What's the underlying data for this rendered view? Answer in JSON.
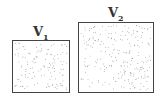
{
  "diagram": {
    "containers": [
      {
        "label_main": "V",
        "label_sub": "1",
        "box": {
          "x": 12,
          "y": 40,
          "w": 58,
          "h": 53
        },
        "particle_count": 130
      },
      {
        "label_main": "V",
        "label_sub": "2",
        "box": {
          "x": 78,
          "y": 22,
          "w": 76,
          "h": 71
        },
        "particle_count": 230
      }
    ],
    "colors": {
      "border": "#444444",
      "particle": "#777777",
      "background": "#ffffff"
    }
  }
}
